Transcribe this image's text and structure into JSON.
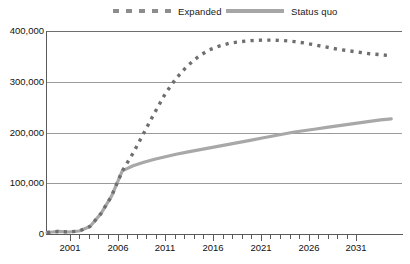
{
  "legend": {
    "position": "top",
    "items": [
      {
        "label": "Expanded",
        "style": "dashed",
        "color": "#6f6f6f",
        "swatch_name": "expanded-legend-swatch"
      },
      {
        "label": "Status quo",
        "style": "solid",
        "color": "#a8a8a8",
        "swatch_name": "status-quo-legend-swatch"
      }
    ]
  },
  "axes": {
    "y_ticks": [
      "400,000",
      "300,000",
      "200,000",
      "100,000",
      "0"
    ],
    "x_ticks": [
      "2001",
      "2006",
      "2011",
      "2016",
      "2021",
      "2026",
      "2031"
    ]
  },
  "chart_data": {
    "type": "line",
    "title": "",
    "subtitle": "",
    "xlabel": "",
    "ylabel": "",
    "xlim": [
      1999,
      2032
    ],
    "ylim": [
      0,
      400000
    ],
    "grid": true,
    "legend_position": "top",
    "ytick_values": [
      0,
      100000,
      200000,
      300000,
      400000
    ],
    "ytick_labels": [
      "0",
      "100,000",
      "200,000",
      "300,000",
      "400,000"
    ],
    "xtick_values": [
      2001,
      2006,
      2011,
      2016,
      2021,
      2026,
      2031
    ],
    "xtick_labels": [
      "2001",
      "2006",
      "2011",
      "2016",
      "2021",
      "2026",
      "2031"
    ],
    "x": [
      1999,
      2000,
      2001,
      2002,
      2003,
      2004,
      2005,
      2006,
      2007,
      2008,
      2009,
      2010,
      2011,
      2012,
      2013,
      2014,
      2015,
      2016,
      2017,
      2018,
      2019,
      2020,
      2021,
      2022,
      2023,
      2024,
      2025,
      2026,
      2027,
      2028,
      2029,
      2030,
      2031
    ],
    "series": [
      {
        "name": "Expanded",
        "style": "dashed",
        "color": "#6f6f6f",
        "values": [
          3000,
          5000,
          4000,
          6000,
          15000,
          40000,
          75000,
          125000,
          160000,
          200000,
          240000,
          278000,
          308000,
          332000,
          350000,
          364000,
          372000,
          378000,
          381000,
          383000,
          384000,
          384000,
          383000,
          381000,
          378000,
          374000,
          370000,
          366000,
          363000,
          360000,
          357000,
          355000,
          353000
        ]
      },
      {
        "name": "Status quo",
        "style": "solid",
        "color": "#a8a8a8",
        "values": [
          3000,
          5000,
          4000,
          6000,
          15000,
          40000,
          75000,
          125000,
          135000,
          142000,
          148000,
          153000,
          158000,
          162000,
          166000,
          170000,
          174000,
          178000,
          182000,
          186000,
          190000,
          194000,
          198000,
          202000,
          205000,
          208000,
          211000,
          214000,
          217000,
          220000,
          223000,
          226000,
          228000
        ]
      }
    ]
  }
}
